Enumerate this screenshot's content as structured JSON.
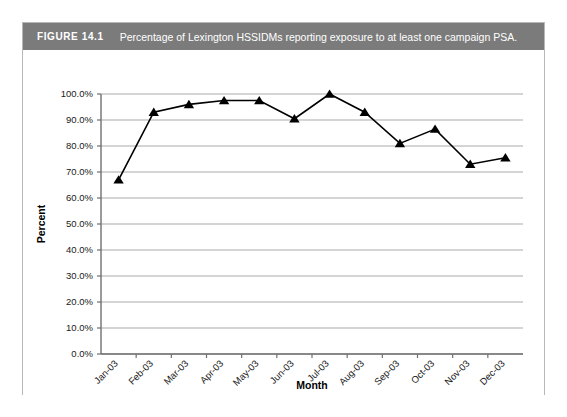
{
  "figure": {
    "label": "FIGURE 14.1",
    "caption": "Percentage of Lexington HSSIDMs reporting exposure to at least one campaign PSA.",
    "bar_color": "#7b7b7b",
    "bar_text_color": "#ffffff",
    "border_color": "#b8b8b8"
  },
  "chart_data": {
    "type": "line",
    "title": "",
    "xlabel": "Month",
    "ylabel": "Percent",
    "categories": [
      "Jan-03",
      "Feb-03",
      "Mar-03",
      "Apr-03",
      "May-03",
      "Jun-03",
      "Jul-03",
      "Aug-03",
      "Sep-03",
      "Oct-03",
      "Nov-03",
      "Dec-03"
    ],
    "values": [
      67.0,
      93.0,
      96.0,
      97.5,
      97.5,
      90.5,
      100.0,
      93.0,
      81.0,
      86.5,
      73.0,
      75.5
    ],
    "ylim": [
      0,
      100
    ],
    "ytick_values": [
      0,
      10,
      20,
      30,
      40,
      50,
      60,
      70,
      80,
      90,
      100
    ],
    "ytick_labels": [
      "0.0%",
      "10.0%",
      "20.0%",
      "30.0%",
      "40.0%",
      "50.0%",
      "60.0%",
      "70.0%",
      "80.0%",
      "90.0%",
      "100.0%"
    ],
    "grid": "horizontal",
    "legend": "none",
    "marker": "triangle",
    "line_color": "#000000",
    "marker_color": "#000000",
    "gridline_color": "#a9a9a9"
  }
}
